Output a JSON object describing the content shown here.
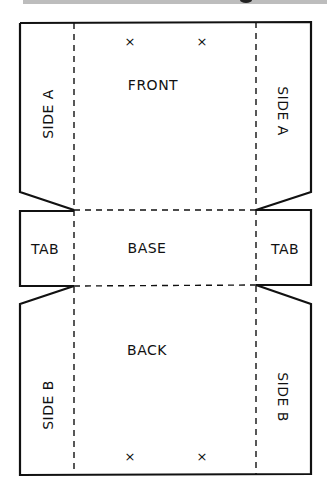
{
  "diagram": {
    "type": "box-net-template",
    "colors": {
      "line": "#111111",
      "background": "#ffffff",
      "top_band": "#bdbdbd"
    },
    "panels": {
      "front": "FRONT",
      "base": "BASE",
      "back": "BACK",
      "side_a_left": "SIDE A",
      "side_a_right": "SIDE A",
      "tab_left": "TAB",
      "tab_right": "TAB",
      "side_b_left": "SIDE B",
      "side_b_right": "SIDE B"
    },
    "marks": {
      "top_left": "×",
      "top_right": "×",
      "bottom_left": "×",
      "bottom_right": "×"
    },
    "legend": {
      "solid_line": "cut",
      "dashed_line": "fold"
    }
  }
}
